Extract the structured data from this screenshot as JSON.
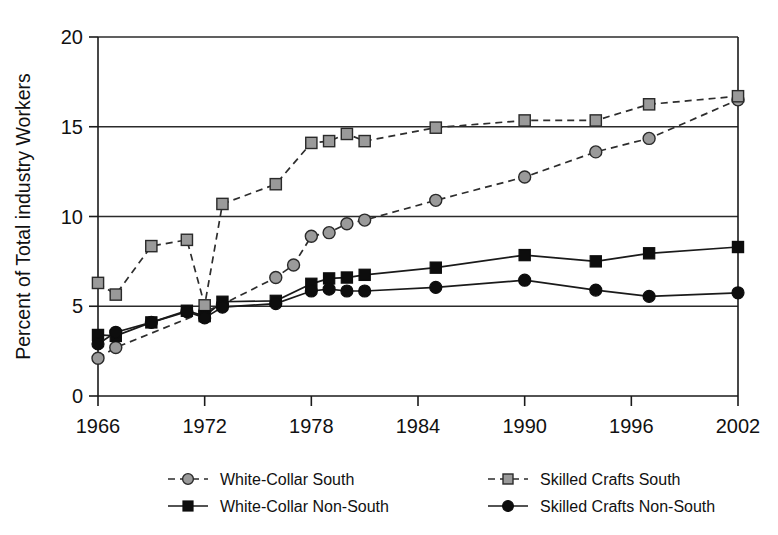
{
  "chart_data": {
    "type": "line",
    "title": "",
    "xlabel": "",
    "ylabel": "Percent of Total industry Workers",
    "xlim": [
      1966,
      2002
    ],
    "ylim": [
      0,
      20
    ],
    "grid": true,
    "legend_position": "bottom",
    "xticks": [
      "1966",
      "1972",
      "1978",
      "1984",
      "1990",
      "1996",
      "2002"
    ],
    "xtick_values": [
      1966,
      1972,
      1978,
      1984,
      1990,
      1996,
      2002
    ],
    "yticks": [
      "0",
      "5",
      "10",
      "15",
      "20"
    ],
    "ytick_values": [
      0,
      5,
      10,
      15,
      20
    ],
    "series": [
      {
        "name": "White-Collar  South",
        "marker": "circle",
        "marker_fill": "#9a9a9a",
        "line_style": "dashed",
        "points": [
          [
            1966,
            2.1
          ],
          [
            1967,
            2.7
          ],
          [
            1972,
            4.7
          ],
          [
            1973,
            5.1
          ],
          [
            1976,
            6.6
          ],
          [
            1977,
            7.3
          ],
          [
            1978,
            8.9
          ],
          [
            1979,
            9.1
          ],
          [
            1980,
            9.6
          ],
          [
            1981,
            9.8
          ],
          [
            1985,
            10.9
          ],
          [
            1990,
            12.2
          ],
          [
            1994,
            13.6
          ],
          [
            1997,
            14.35
          ],
          [
            2002,
            16.5
          ]
        ]
      },
      {
        "name": "Skilled Crafts South",
        "marker": "square",
        "marker_fill": "#9a9a9a",
        "line_style": "dashed",
        "points": [
          [
            1966,
            6.3
          ],
          [
            1967,
            5.65
          ],
          [
            1969,
            8.35
          ],
          [
            1971,
            8.7
          ],
          [
            1972,
            5.05
          ],
          [
            1973,
            10.7
          ],
          [
            1976,
            11.8
          ],
          [
            1978,
            14.1
          ],
          [
            1979,
            14.2
          ],
          [
            1980,
            14.6
          ],
          [
            1981,
            14.2
          ],
          [
            1985,
            14.95
          ],
          [
            1990,
            15.35
          ],
          [
            1994,
            15.35
          ],
          [
            1997,
            16.25
          ],
          [
            2002,
            16.7
          ]
        ]
      },
      {
        "name": "White-Collar Non-South",
        "marker": "square",
        "marker_fill": "#0d0d0d",
        "line_style": "solid",
        "points": [
          [
            1966,
            3.4
          ],
          [
            1967,
            3.35
          ],
          [
            1969,
            4.1
          ],
          [
            1971,
            4.75
          ],
          [
            1972,
            4.45
          ],
          [
            1973,
            5.25
          ],
          [
            1976,
            5.3
          ],
          [
            1978,
            6.25
          ],
          [
            1979,
            6.55
          ],
          [
            1980,
            6.6
          ],
          [
            1981,
            6.75
          ],
          [
            1985,
            7.15
          ],
          [
            1990,
            7.85
          ],
          [
            1994,
            7.5
          ],
          [
            1997,
            7.95
          ],
          [
            2002,
            8.3
          ]
        ]
      },
      {
        "name": "Skilled Crafts Non-South",
        "marker": "circle",
        "marker_fill": "#0d0d0d",
        "line_style": "solid",
        "points": [
          [
            1966,
            2.9
          ],
          [
            1967,
            3.55
          ],
          [
            1969,
            4.1
          ],
          [
            1971,
            4.7
          ],
          [
            1972,
            4.35
          ],
          [
            1973,
            4.95
          ],
          [
            1976,
            5.15
          ],
          [
            1978,
            5.85
          ],
          [
            1979,
            5.95
          ],
          [
            1980,
            5.85
          ],
          [
            1981,
            5.85
          ],
          [
            1985,
            6.05
          ],
          [
            1990,
            6.45
          ],
          [
            1994,
            5.9
          ],
          [
            1997,
            5.55
          ],
          [
            2002,
            5.75
          ]
        ]
      }
    ],
    "legend": [
      {
        "label": "White-Collar  South",
        "marker": "circle",
        "marker_fill": "#9a9a9a",
        "line_style": "dashed"
      },
      {
        "label": "Skilled Crafts South",
        "marker": "square",
        "marker_fill": "#9a9a9a",
        "line_style": "dashed"
      },
      {
        "label": "White-Collar Non-South",
        "marker": "square",
        "marker_fill": "#0d0d0d",
        "line_style": "solid"
      },
      {
        "label": "Skilled Crafts Non-South",
        "marker": "circle",
        "marker_fill": "#0d0d0d",
        "line_style": "solid"
      }
    ]
  },
  "colors": {
    "south_marker": "#9a9a9a",
    "non_south_marker": "#0d0d0d",
    "axis": "#1a1a1a",
    "background": "#ffffff"
  }
}
